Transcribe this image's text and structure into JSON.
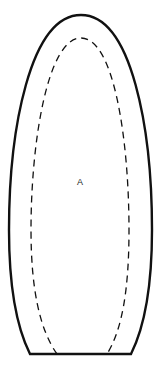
{
  "diagram": {
    "label": "A",
    "colors": {
      "background": "#ffffff",
      "stroke": "#111111"
    },
    "shapes": [
      {
        "name": "outer-outline",
        "style": "solid"
      },
      {
        "name": "inner-outline",
        "style": "dashed"
      }
    ]
  }
}
